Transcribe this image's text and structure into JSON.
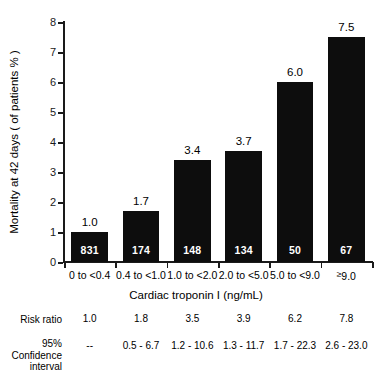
{
  "chart_data": {
    "type": "bar",
    "title": "",
    "xlabel": "Cardiac troponin I (ng/mL)",
    "ylabel": "Mortality at 42 days ( of patients % )",
    "ylim": [
      0,
      8
    ],
    "yticks": [
      0,
      1,
      2,
      3,
      4,
      5,
      6,
      7,
      8
    ],
    "ytick_labels": [
      "0",
      "1",
      "2",
      "3",
      "4",
      "5",
      "6",
      "7",
      "8"
    ],
    "grid": false,
    "legend": "none",
    "bar_color": "#0d0d0d",
    "categories": [
      "0 to <0.4",
      "0.4 to <1.0",
      "1.0 to <2.0",
      "2.0 to <5.0",
      "5.0 to <9.0",
      "≥9.0"
    ],
    "values": [
      1.0,
      1.7,
      3.4,
      3.7,
      6.0,
      7.5
    ],
    "value_labels": [
      "1.0",
      "1.7",
      "3.4",
      "3.7",
      "6.0",
      "7.5"
    ],
    "patient_counts": [
      "831",
      "174",
      "148",
      "134",
      "50",
      "67"
    ]
  },
  "table": {
    "rows": [
      {
        "label": "Risk ratio",
        "values": [
          "1.0",
          "1.8",
          "3.5",
          "3.9",
          "6.2",
          "7.8"
        ]
      },
      {
        "label": "95%\nConfidence\ninterval",
        "label_lines": [
          "95%",
          "Confidence",
          "interval"
        ],
        "values": [
          "--",
          "0.5 - 6.7",
          "1.2 - 10.6",
          "1.3 - 11.7",
          "1.7 - 22.3",
          "2.6 - 23.0"
        ]
      }
    ]
  }
}
